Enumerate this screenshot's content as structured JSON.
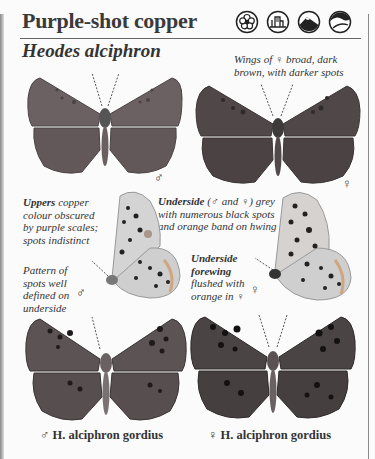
{
  "page": {
    "common_name": "Purple-shot copper",
    "scientific_name": "Heodes alciphron",
    "habitat_icons": [
      "flower-meadow-icon",
      "village-garden-icon",
      "mountain-icon",
      "hillside-icon"
    ]
  },
  "notes": {
    "female_wings": "Wings of ♀ broad, dark brown, with darker spots",
    "uppers_bold": "Uppers",
    "uppers_rest": " copper colour obscured by purple scales; spots indistinct",
    "underside_bold": "Underside",
    "underside_rest": " (♂ and ♀) grey with numerous black spots and orange band on hwing",
    "pattern": "Pattern of spots well defined on underside",
    "forewing_bold": "Underside forewing",
    "forewing_rest": " flushed with orange in ♀"
  },
  "sex_labels": {
    "male": "♂",
    "female": "♀"
  },
  "captions": {
    "male_gordius": "♂ H. alciphron gordius",
    "female_gordius": "♀ H. alciphron gordius"
  },
  "colors": {
    "wing_male": "#6a5f60",
    "wing_female": "#4f4748",
    "underside": "#cfcfcf",
    "text": "#333333"
  }
}
